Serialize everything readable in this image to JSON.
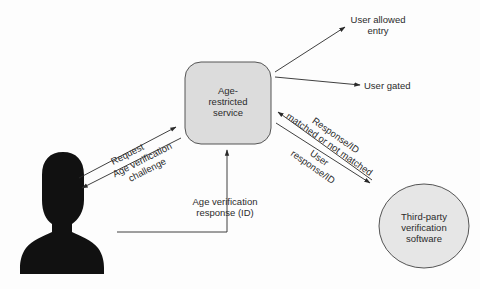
{
  "diagram": {
    "nodes": {
      "service": {
        "label_line1": "Age-",
        "label_line2": "restricted",
        "label_line3": "service",
        "shape": "rounded-rectangle",
        "fill": "#dcdcdc"
      },
      "user": {
        "label": "User",
        "shape": "person-silhouette",
        "fill": "#111111"
      },
      "third_party": {
        "label_line1": "Third-party",
        "label_line2": "verification",
        "label_line3": "software",
        "shape": "ellipse",
        "fill": "#e6e6e6"
      },
      "allowed": {
        "label_line1": "User allowed",
        "label_line2": "entry"
      },
      "gated": {
        "label": "User gated"
      }
    },
    "edges": {
      "request": {
        "label": "Request",
        "from": "user",
        "to": "service"
      },
      "challenge": {
        "label_line1": "Age verification",
        "label_line2": "challenge",
        "from": "service",
        "to": "user"
      },
      "response": {
        "label_line1": "Age verification",
        "label_line2": "response (ID)",
        "from": "user",
        "to": "service"
      },
      "to_third_party": {
        "label_line1": "User",
        "label_line2": "response/ID",
        "from": "service",
        "to": "third_party"
      },
      "from_third_party": {
        "label_line1": "Response/ID",
        "label_line2": "matched or not matched",
        "from": "third_party",
        "to": "service"
      },
      "to_allowed": {
        "from": "service",
        "to": "allowed"
      },
      "to_gated": {
        "from": "service",
        "to": "gated"
      }
    },
    "colors": {
      "line": "#2a2a2a",
      "background": "#fdfdfd",
      "node_stroke": "#555555"
    }
  }
}
